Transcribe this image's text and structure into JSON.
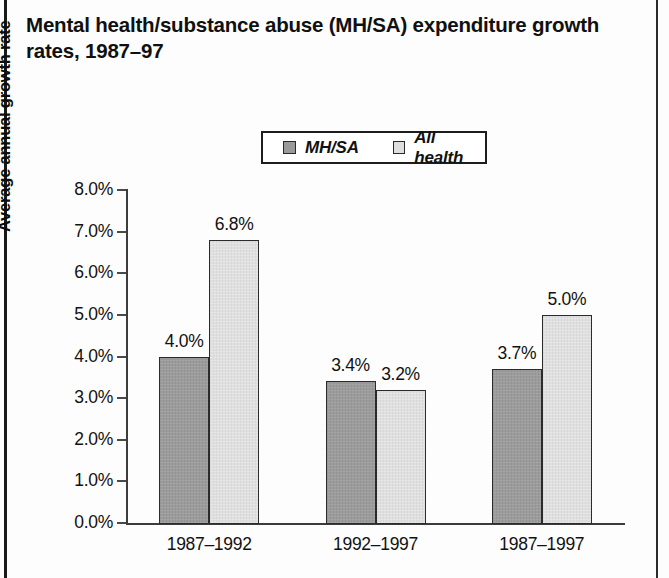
{
  "figure": {
    "title": "Mental health/substance abuse (MH/SA) expenditure growth rates, 1987–97"
  },
  "chart_data": {
    "type": "bar",
    "title": "Mental health/substance abuse (MH/SA) expenditure growth rates, 1987–97",
    "xlabel": "",
    "ylabel": "Average annual growth rate",
    "categories": [
      "1987–1992",
      "1992–1997",
      "1987–1997"
    ],
    "series": [
      {
        "name": "MH/SA",
        "color": "#9b9b9b",
        "values": [
          4.0,
          3.4,
          3.7
        ],
        "labels": [
          "4.0%",
          "3.4%",
          "3.7%"
        ]
      },
      {
        "name": "All health",
        "color": "#dfdfdf",
        "values": [
          6.8,
          3.2,
          5.0
        ],
        "labels": [
          "6.8%",
          "3.2%",
          "5.0%"
        ]
      }
    ],
    "ylim": [
      0.0,
      8.0
    ],
    "ytick_values": [
      8.0,
      7.0,
      6.0,
      5.0,
      4.0,
      3.0,
      2.0,
      1.0,
      0.0
    ],
    "ytick_labels": [
      "8.0%",
      "7.0%",
      "6.0%",
      "5.0%",
      "4.0%",
      "3.0%",
      "2.0%",
      "1.0%",
      "0.0%"
    ],
    "grid": false,
    "legend_position": "top-center",
    "legend_entries": [
      "MH/SA",
      "All health"
    ]
  }
}
